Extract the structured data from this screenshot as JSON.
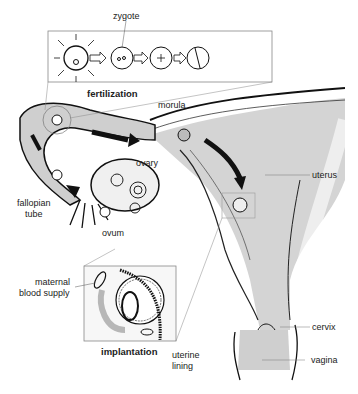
{
  "diagram": {
    "insets": {
      "top": {
        "caption": "fertilization",
        "stages": [
          "sperm-surrounded ovum",
          "zygote",
          "dividing cell",
          "two-cell stage"
        ]
      },
      "bottom": {
        "caption": "implantation"
      }
    },
    "labels": {
      "zygote": "zygote",
      "fertilization": "fertilization",
      "morula": "morula",
      "ovary": "ovary",
      "uterus": "uterus",
      "fallopian_tube_1": "fallopian",
      "fallopian_tube_2": "tube",
      "ovum": "ovum",
      "maternal_1": "maternal",
      "maternal_2": "blood supply",
      "implantation": "implantation",
      "uterine_1": "uterine",
      "uterine_2": "lining",
      "cervix": "cervix",
      "vagina": "vagina"
    },
    "colors": {
      "line": "#1a1a1a",
      "shade": "#c8c8c8",
      "light": "#e6e6e6",
      "text": "#222222"
    }
  }
}
